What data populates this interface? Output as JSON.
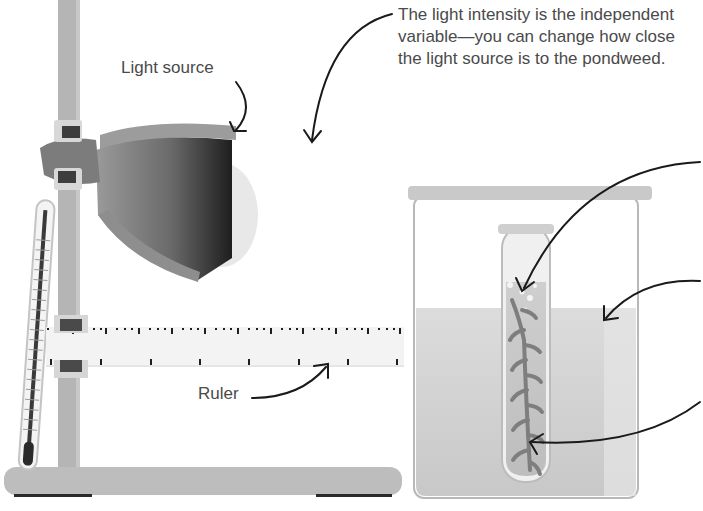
{
  "diagram": {
    "labels": {
      "light_source": "Light source",
      "ruler": "Ruler",
      "independent_variable_note": "The light intensity is the independent variable—you can change how close the light source is to the pondweed."
    },
    "components": [
      {
        "name": "clamp-stand",
        "description": "Retort stand with vertical rod and base"
      },
      {
        "name": "lamp",
        "description": "Lamp clamped to stand, shining right"
      },
      {
        "name": "thermometer",
        "description": "Thermometer leaning against stand"
      },
      {
        "name": "ruler",
        "description": "Horizontal ruler clamped to stand, reaching beaker"
      },
      {
        "name": "beaker",
        "description": "Beaker of water"
      },
      {
        "name": "test-tube",
        "description": "Test tube with bubbles"
      },
      {
        "name": "pondweed",
        "description": "Pondweed sprig inside test tube"
      }
    ],
    "arrows": [
      {
        "from": "light-source-label",
        "to": "lamp"
      },
      {
        "from": "independent-variable-note",
        "to": "lamp-gap"
      },
      {
        "from": "ruler-label",
        "to": "ruler"
      },
      {
        "from": "right-edge-1",
        "to": "test-tube-bubbles"
      },
      {
        "from": "right-edge-2",
        "to": "beaker-water"
      },
      {
        "from": "right-edge-3",
        "to": "pondweed"
      }
    ],
    "colors": {
      "text": "#4a4a4a",
      "arrow": "#1a1a1a",
      "stand": "#b8b8b8",
      "water": "#d6d6d6",
      "lamp_dark": "#2e2e2e",
      "pondweed": "#8a8a8a"
    }
  }
}
